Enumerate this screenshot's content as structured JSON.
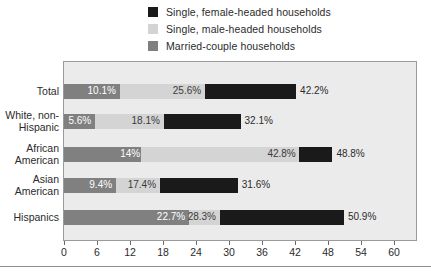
{
  "legend": {
    "items": [
      {
        "label": "Single, female-headed households",
        "color": "#1a1a1a",
        "key": "single_female"
      },
      {
        "label": "Single, male-headed households",
        "color": "#d4d4d4",
        "key": "single_male"
      },
      {
        "label": "Married-couple households",
        "color": "#808080",
        "key": "married_couple"
      }
    ]
  },
  "axis": {
    "ticks": [
      0,
      6,
      12,
      18,
      24,
      30,
      36,
      42,
      48,
      54,
      60
    ],
    "tick_labels": [
      "0",
      "6",
      "12",
      "18",
      "24",
      "30",
      "36",
      "42",
      "48",
      "54",
      "60"
    ],
    "min": 0,
    "max": 64
  },
  "chart_data": {
    "type": "bar",
    "orientation": "horizontal",
    "stacked": true,
    "title": "",
    "xlabel": "",
    "ylabel": "",
    "xlim": [
      0,
      64
    ],
    "grid": false,
    "legend_position": "top",
    "categories": [
      "Total",
      "White, non-Hispanic",
      "African American",
      "Asian American",
      "Hispanics"
    ],
    "series": [
      {
        "name": "Married-couple households",
        "color": "#808080",
        "values": [
          10.1,
          5.6,
          14.0,
          9.4,
          22.7
        ]
      },
      {
        "name": "Single, male-headed households",
        "color": "#d4d4d4",
        "values": [
          15.5,
          12.5,
          28.8,
          8.0,
          5.6
        ]
      },
      {
        "name": "Single, female-headed households",
        "color": "#1a1a1a",
        "values": [
          16.6,
          14.0,
          6.0,
          14.2,
          22.6
        ]
      }
    ],
    "cumulative_labels": [
      [
        "10.1%",
        "25.6%",
        "42.2%"
      ],
      [
        "5.6%",
        "18.1%",
        "32.1%"
      ],
      [
        "14%",
        "42.8%",
        "48.8%"
      ],
      [
        "9.4%",
        "17.4%",
        "31.6%"
      ],
      [
        "22.7%",
        "28.3%",
        "50.9%"
      ]
    ],
    "cumulative_values": [
      [
        10.1,
        25.6,
        42.2
      ],
      [
        5.6,
        18.1,
        32.1
      ],
      [
        14.0,
        42.8,
        48.8
      ],
      [
        9.4,
        17.4,
        31.6
      ],
      [
        22.7,
        28.3,
        50.9
      ]
    ]
  },
  "rows": [
    {
      "label_lines": [
        "Total"
      ]
    },
    {
      "label_lines": [
        "White, non-",
        "Hispanic"
      ]
    },
    {
      "label_lines": [
        "African",
        "American"
      ]
    },
    {
      "label_lines": [
        "Asian",
        "American"
      ]
    },
    {
      "label_lines": [
        "Hispanics"
      ]
    }
  ]
}
